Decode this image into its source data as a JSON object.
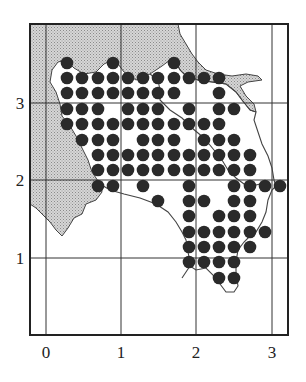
{
  "map": {
    "title": "",
    "frame": {
      "left": 30,
      "top": 24,
      "right": 288,
      "bottom": 335,
      "stroke": "#222222"
    },
    "colors": {
      "shaded_region": "#c8c8c8",
      "coastline": "#444444",
      "dot": "#2a2a2a",
      "gridline": "#333333"
    },
    "axes": {
      "x_ticks": [
        {
          "label": "0",
          "px": 46
        },
        {
          "label": "1",
          "px": 121
        },
        {
          "label": "2",
          "px": 196
        },
        {
          "label": "3",
          "px": 272
        }
      ],
      "y_ticks": [
        {
          "label": "3",
          "px": 103
        },
        {
          "label": "2",
          "px": 180
        },
        {
          "label": "1",
          "px": 258
        }
      ]
    },
    "dot_grid": {
      "cols_px": [
        67,
        82,
        98,
        113,
        128,
        143,
        158,
        174,
        189,
        204,
        219,
        234,
        250,
        265,
        280
      ],
      "rows_px": [
        63,
        78,
        93,
        109,
        124,
        140,
        155,
        170,
        186,
        201,
        216,
        232,
        247,
        262,
        278
      ],
      "radius": 6.3
    },
    "dots": [
      [
        0,
        0
      ],
      [
        3,
        0
      ],
      [
        7,
        0
      ],
      [
        0,
        1
      ],
      [
        1,
        1
      ],
      [
        2,
        1
      ],
      [
        3,
        1
      ],
      [
        4,
        1
      ],
      [
        5,
        1
      ],
      [
        6,
        1
      ],
      [
        7,
        1
      ],
      [
        8,
        1
      ],
      [
        9,
        1
      ],
      [
        10,
        1
      ],
      [
        0,
        2
      ],
      [
        1,
        2
      ],
      [
        2,
        2
      ],
      [
        3,
        2
      ],
      [
        4,
        2
      ],
      [
        5,
        2
      ],
      [
        6,
        2
      ],
      [
        7,
        2
      ],
      [
        10,
        2
      ],
      [
        0,
        3
      ],
      [
        1,
        3
      ],
      [
        2,
        3
      ],
      [
        4,
        3
      ],
      [
        5,
        3
      ],
      [
        6,
        3
      ],
      [
        8,
        3
      ],
      [
        10,
        3
      ],
      [
        11,
        3
      ],
      [
        0,
        4
      ],
      [
        1,
        4
      ],
      [
        2,
        4
      ],
      [
        3,
        4
      ],
      [
        4,
        4
      ],
      [
        5,
        4
      ],
      [
        6,
        4
      ],
      [
        7,
        4
      ],
      [
        8,
        4
      ],
      [
        9,
        4
      ],
      [
        10,
        4
      ],
      [
        1,
        5
      ],
      [
        2,
        5
      ],
      [
        3,
        5
      ],
      [
        5,
        5
      ],
      [
        6,
        5
      ],
      [
        7,
        5
      ],
      [
        9,
        5
      ],
      [
        10,
        5
      ],
      [
        11,
        5
      ],
      [
        2,
        6
      ],
      [
        3,
        6
      ],
      [
        4,
        6
      ],
      [
        5,
        6
      ],
      [
        6,
        6
      ],
      [
        7,
        6
      ],
      [
        8,
        6
      ],
      [
        9,
        6
      ],
      [
        10,
        6
      ],
      [
        11,
        6
      ],
      [
        12,
        6
      ],
      [
        2,
        7
      ],
      [
        3,
        7
      ],
      [
        4,
        7
      ],
      [
        5,
        7
      ],
      [
        6,
        7
      ],
      [
        7,
        7
      ],
      [
        8,
        7
      ],
      [
        9,
        7
      ],
      [
        10,
        7
      ],
      [
        11,
        7
      ],
      [
        12,
        7
      ],
      [
        2,
        8
      ],
      [
        3,
        8
      ],
      [
        5,
        8
      ],
      [
        8,
        8
      ],
      [
        11,
        8
      ],
      [
        12,
        8
      ],
      [
        13,
        8
      ],
      [
        14,
        8
      ],
      [
        6,
        9
      ],
      [
        8,
        9
      ],
      [
        9,
        9
      ],
      [
        11,
        9
      ],
      [
        12,
        9
      ],
      [
        8,
        10
      ],
      [
        10,
        10
      ],
      [
        11,
        10
      ],
      [
        12,
        10
      ],
      [
        8,
        11
      ],
      [
        9,
        11
      ],
      [
        10,
        11
      ],
      [
        11,
        11
      ],
      [
        12,
        11
      ],
      [
        13,
        11
      ],
      [
        8,
        12
      ],
      [
        9,
        12
      ],
      [
        10,
        12
      ],
      [
        11,
        12
      ],
      [
        12,
        12
      ],
      [
        8,
        13
      ],
      [
        9,
        13
      ],
      [
        10,
        13
      ],
      [
        11,
        13
      ],
      [
        10,
        14
      ],
      [
        11,
        14
      ]
    ],
    "shaded_path": "M30,24 L178,24 L180,34 L186,44 L192,54 L198,62 L206,70 L218,74 L232,76 L246,74 L258,76 L262,80 L248,82 L240,86 L246,96 L254,104 L256,112 L250,110 L242,100 L236,92 L226,84 L212,82 L198,80 L186,76 L180,70 L176,62 L170,60 L162,66 L150,74 L136,80 L124,72 L118,64 L112,60 L104,64 L96,72 L84,74 L74,68 L66,60 L58,62 L52,70 L50,82 L56,92 L60,104 L62,116 L70,126 L76,136 L82,148 L88,160 L92,172 L100,184 L102,192 L96,200 L86,204 L82,214 L74,218 L68,228 L62,236 L56,230 L50,222 L44,216 L36,208 L30,204 Z",
    "coast_path": "M170,60 L176,62 L180,70 L186,76 L198,80 L212,82 L226,84 L236,92 L242,100 L250,110 L256,112 L254,120 L258,132 L262,144 L268,156 L272,168 L274,180 L276,186 L272,190 L268,200 L266,212 L262,222 L256,232 L250,236 L244,242 L238,250 L236,262 L236,274 L238,286 L234,292 L226,292 L220,284 L214,276 L206,268 L196,270 L190,266 L186,272 L182,278 M100,184 L110,190 L124,194 L140,198 L156,204 L168,212 L176,222 L182,232 L186,240 L188,252 L190,262 M150,74 L158,80 L160,90 L160,100 L170,110 L182,118 L192,128 L204,138 L214,150 L222,160 L228,170 L236,178 L244,184 L252,186 L260,184 L268,186",
    "annotations": []
  },
  "chart_data": {
    "type": "scatter",
    "title": "",
    "xlabel": "",
    "ylabel": "",
    "xlim": [
      -0.21,
      3.21
    ],
    "ylim": [
      0,
      4.03
    ],
    "x_ticks": [
      "0",
      "1",
      "2",
      "3"
    ],
    "y_ticks": [
      "1",
      "2",
      "3"
    ],
    "grid": true,
    "legend": null,
    "series": [
      {
        "name": "occurrence",
        "points_xy": [
          [
            0.28,
            3.51
          ],
          [
            0.89,
            3.51
          ],
          [
            1.7,
            3.51
          ],
          [
            0.28,
            3.32
          ],
          [
            0.48,
            3.32
          ],
          [
            0.69,
            3.32
          ],
          [
            0.89,
            3.32
          ],
          [
            1.09,
            3.32
          ],
          [
            1.29,
            3.32
          ],
          [
            1.48,
            3.32
          ],
          [
            1.7,
            3.32
          ],
          [
            1.89,
            3.32
          ],
          [
            2.09,
            3.32
          ],
          [
            2.29,
            3.32
          ],
          [
            0.28,
            3.13
          ],
          [
            0.48,
            3.13
          ],
          [
            0.69,
            3.13
          ],
          [
            0.89,
            3.13
          ],
          [
            1.09,
            3.13
          ],
          [
            1.29,
            3.13
          ],
          [
            1.48,
            3.13
          ],
          [
            1.7,
            3.13
          ],
          [
            2.29,
            3.13
          ],
          [
            0.28,
            2.92
          ],
          [
            0.48,
            2.92
          ],
          [
            0.69,
            2.92
          ],
          [
            1.09,
            2.92
          ],
          [
            1.29,
            2.92
          ],
          [
            1.48,
            2.92
          ],
          [
            1.89,
            2.92
          ],
          [
            2.29,
            2.92
          ],
          [
            2.49,
            2.92
          ],
          [
            0.28,
            2.73
          ],
          [
            0.48,
            2.73
          ],
          [
            0.69,
            2.73
          ],
          [
            0.89,
            2.73
          ],
          [
            1.09,
            2.73
          ],
          [
            1.29,
            2.73
          ],
          [
            1.48,
            2.73
          ],
          [
            1.7,
            2.73
          ],
          [
            1.89,
            2.73
          ],
          [
            2.09,
            2.73
          ],
          [
            2.29,
            2.73
          ],
          [
            0.48,
            2.52
          ],
          [
            0.69,
            2.52
          ],
          [
            0.89,
            2.52
          ],
          [
            1.29,
            2.52
          ],
          [
            1.48,
            2.52
          ],
          [
            1.7,
            2.52
          ],
          [
            2.09,
            2.52
          ],
          [
            2.29,
            2.52
          ],
          [
            2.49,
            2.52
          ],
          [
            0.69,
            2.33
          ],
          [
            0.89,
            2.33
          ],
          [
            1.09,
            2.33
          ],
          [
            1.29,
            2.33
          ],
          [
            1.48,
            2.33
          ],
          [
            1.7,
            2.33
          ],
          [
            1.89,
            2.33
          ],
          [
            2.09,
            2.33
          ],
          [
            2.29,
            2.33
          ],
          [
            2.49,
            2.33
          ],
          [
            2.7,
            2.33
          ],
          [
            0.69,
            2.13
          ],
          [
            0.89,
            2.13
          ],
          [
            1.09,
            2.13
          ],
          [
            1.29,
            2.13
          ],
          [
            1.48,
            2.13
          ],
          [
            1.7,
            2.13
          ],
          [
            1.89,
            2.13
          ],
          [
            2.09,
            2.13
          ],
          [
            2.29,
            2.13
          ],
          [
            2.49,
            2.13
          ],
          [
            2.7,
            2.13
          ],
          [
            0.69,
            1.93
          ],
          [
            0.89,
            1.93
          ],
          [
            1.29,
            1.93
          ],
          [
            1.89,
            1.93
          ],
          [
            2.49,
            1.93
          ],
          [
            2.7,
            1.93
          ],
          [
            2.9,
            1.93
          ],
          [
            3.1,
            1.93
          ],
          [
            1.48,
            1.73
          ],
          [
            1.89,
            1.73
          ],
          [
            2.09,
            1.73
          ],
          [
            2.49,
            1.73
          ],
          [
            2.7,
            1.73
          ],
          [
            1.89,
            1.54
          ],
          [
            2.29,
            1.54
          ],
          [
            2.49,
            1.54
          ],
          [
            2.7,
            1.54
          ],
          [
            1.89,
            1.33
          ],
          [
            2.09,
            1.33
          ],
          [
            2.29,
            1.33
          ],
          [
            2.49,
            1.33
          ],
          [
            2.7,
            1.33
          ],
          [
            2.9,
            1.33
          ],
          [
            1.89,
            1.14
          ],
          [
            2.09,
            1.14
          ],
          [
            2.29,
            1.14
          ],
          [
            2.49,
            1.14
          ],
          [
            2.7,
            1.14
          ],
          [
            1.89,
            0.94
          ],
          [
            2.09,
            0.94
          ],
          [
            2.29,
            0.94
          ],
          [
            2.49,
            0.94
          ],
          [
            2.29,
            0.73
          ],
          [
            2.49,
            0.73
          ]
        ]
      }
    ]
  }
}
